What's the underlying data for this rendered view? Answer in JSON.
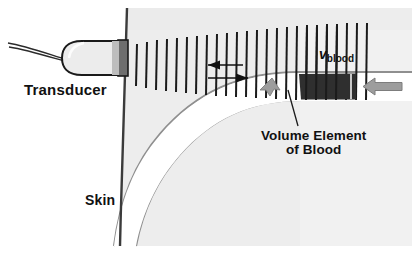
{
  "figure": {
    "width": 412,
    "height": 254,
    "background_color": "#ffffff"
  },
  "labels": {
    "transducer": "Transducer",
    "skin": "Skin",
    "v_symbol": "v",
    "v_subscript": "blood",
    "volume_element_line1": "Volume Element",
    "volume_element_line2": "of Blood"
  },
  "colors": {
    "tissue_fill": "#eeeeee",
    "tissue_fill_light": "#f2f2f2",
    "vessel_fill": "#ffffff",
    "vessel_outline": "#8a8a8a",
    "skin_line": "#3a3a3a",
    "wave_line": "#1a1a1a",
    "transducer_body": "#e9e9e9",
    "transducer_tip": "#6b6b6b",
    "transducer_outline": "#1a1a1a",
    "cable": "#2a2a2a",
    "flow_arrow": "#9a9a9a",
    "flow_arrow_outline": "#7a7a7a",
    "scatter_arrow": "#9a9a9a",
    "volume_element_block": "#2e2e2e",
    "text": "#111111",
    "leader_line": "#1a1a1a"
  },
  "elements": {
    "skin_line": {
      "x_top": 127,
      "y_top": 8,
      "x_bottom": 120,
      "y_bottom": 244
    },
    "transducer": {
      "body_x": 64,
      "body_y": 41,
      "body_width": 62,
      "body_height": 34,
      "tip_x": 118,
      "tip_width": 10
    },
    "cable": {
      "start_x": 8,
      "start_y": 44,
      "end_x": 66,
      "end_y": 60
    },
    "wave_lines": {
      "count": 22,
      "origin_x": 128,
      "origin_y": 60,
      "description": "fan of vertical ultrasound wavefront lines spreading right from the skin"
    },
    "wavelength_arrows": {
      "count": 2,
      "description": "two horizontal double-tipped arrows marking one wavelength between wavefronts"
    },
    "vessel": {
      "description": "blood vessel running horizontally at right then curving down-left",
      "outer_y": 72,
      "inner_y": 100
    },
    "volume_element_block": {
      "x": 300,
      "y": 70,
      "width": 54,
      "height": 28
    },
    "flow_arrow": {
      "x": 363,
      "y": 84,
      "direction": "left"
    },
    "scatter_arrow": {
      "x": 268,
      "y": 86,
      "direction": "down-left"
    },
    "leader_line": {
      "x1": 288,
      "y1": 92,
      "x2": 297,
      "y2": 126
    }
  }
}
